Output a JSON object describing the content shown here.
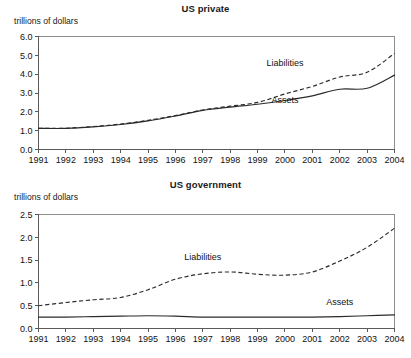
{
  "chart_data": [
    {
      "type": "line",
      "title": "US private",
      "ylabel": "trillions of dollars",
      "xlabel": "",
      "categories": [
        1991,
        1992,
        1993,
        1994,
        1995,
        1996,
        1997,
        1998,
        1999,
        2000,
        2001,
        2002,
        2003,
        2004
      ],
      "ylim": [
        0.0,
        6.0
      ],
      "yticks": [
        "0.0",
        "1.0",
        "2.0",
        "3.0",
        "4.0",
        "5.0",
        "6.0"
      ],
      "xticks": [
        "1991",
        "1992",
        "1993",
        "1994",
        "1995",
        "1996",
        "1997",
        "1998",
        "1999",
        "2000",
        "2001",
        "2002",
        "2003",
        "2004"
      ],
      "grid": false,
      "legend_position": "inline-annotation",
      "series": [
        {
          "name": "Liabilities",
          "style": "dashed",
          "values": [
            1.12,
            1.13,
            1.22,
            1.35,
            1.55,
            1.8,
            2.1,
            2.3,
            2.5,
            2.95,
            3.35,
            3.85,
            4.1,
            5.1
          ],
          "label_x": 2000,
          "label_y": 4.45
        },
        {
          "name": "Assets",
          "style": "solid",
          "values": [
            1.12,
            1.12,
            1.2,
            1.33,
            1.52,
            1.78,
            2.08,
            2.25,
            2.4,
            2.6,
            2.85,
            3.2,
            3.25,
            3.95
          ],
          "label_x": 2000,
          "label_y": 2.45
        }
      ]
    },
    {
      "type": "line",
      "title": "US government",
      "ylabel": "trillions of dollars",
      "xlabel": "",
      "categories": [
        1991,
        1992,
        1993,
        1994,
        1995,
        1996,
        1997,
        1998,
        1999,
        2000,
        2001,
        2002,
        2003,
        2004
      ],
      "ylim": [
        0.0,
        2.5
      ],
      "yticks": [
        "0.0",
        "0.5",
        "1.0",
        "1.5",
        "2.0",
        "2.5"
      ],
      "xticks": [
        "1991",
        "1992",
        "1993",
        "1994",
        "1995",
        "1996",
        "1997",
        "1998",
        "1999",
        "2000",
        "2001",
        "2002",
        "2003",
        "2004"
      ],
      "grid": false,
      "legend_position": "inline-annotation",
      "series": [
        {
          "name": "Liabilities",
          "style": "dashed",
          "values": [
            0.5,
            0.57,
            0.63,
            0.68,
            0.85,
            1.08,
            1.2,
            1.24,
            1.19,
            1.17,
            1.24,
            1.48,
            1.78,
            2.2
          ],
          "label_x": 1997,
          "label_y": 1.5
        },
        {
          "name": "Assets",
          "style": "solid",
          "values": [
            0.25,
            0.25,
            0.26,
            0.27,
            0.28,
            0.27,
            0.25,
            0.25,
            0.25,
            0.25,
            0.25,
            0.26,
            0.28,
            0.3
          ],
          "label_x": 2002,
          "label_y": 0.52
        }
      ]
    }
  ]
}
